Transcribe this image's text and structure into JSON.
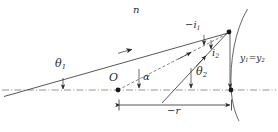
{
  "figure": {
    "type": "optics-ray-diagram",
    "canvas": {
      "width": 278,
      "height": 132
    },
    "colors": {
      "ink": "#2b2b2b",
      "axis": "#6f6f6f",
      "ray": "#3a3a3a",
      "background": "#ffffff"
    }
  },
  "labels": {
    "medium_index": {
      "text": "n",
      "x": 133,
      "y": 6
    },
    "angle_theta1": {
      "base": "θ",
      "sub": "1",
      "x": 56,
      "y": 60
    },
    "angle_theta2": {
      "base": "θ",
      "sub": "2",
      "x": 196,
      "y": 68
    },
    "angle_alpha": {
      "text": "α",
      "x": 142,
      "y": 74
    },
    "angle_i1": {
      "base": "−i",
      "sub": "1",
      "x": 186,
      "y": 22
    },
    "angle_i2": {
      "base": "i",
      "sub": "2",
      "x": 210,
      "y": 50
    },
    "object_point": {
      "text": "O",
      "x": 110,
      "y": 74
    },
    "height_y": {
      "base": "y",
      "sub": "1",
      "mid": "=y",
      "sub2": "2",
      "x": 241,
      "y": 55
    },
    "radius": {
      "base": "−r",
      "x": 168,
      "y": 108
    }
  },
  "geometry": {
    "optical_axis": {
      "y": 90,
      "x_start": 2,
      "x_end": 276,
      "style": "dash-dot"
    },
    "points": {
      "object_O": {
        "x": 118,
        "y": 90
      },
      "vertex_V": {
        "x": 232,
        "y": 90
      },
      "hit_point_P": {
        "x": 228,
        "y": 33
      }
    },
    "incident_ray": {
      "from_x": 4,
      "from_y": 96,
      "to_x": 228,
      "to_y": 33
    },
    "dashed_chord": {
      "from_x": 118,
      "from_y": 90,
      "to_x": 228,
      "to_y": 33
    },
    "normal_radius_line": {
      "from_x": 163,
      "from_y": 102,
      "to_x": 230,
      "to_y": 30
    },
    "height_drop_line": {
      "x": 230,
      "from_y": 33,
      "to_y": 90
    },
    "surface_arc": {
      "top_x": 247,
      "top_y": 9,
      "vertex_x": 231,
      "vertex_y": 90,
      "bottom_x": 239,
      "bottom_y": 121
    },
    "dimension_line": {
      "y": 105,
      "x_start": 118,
      "x_end": 232
    }
  }
}
